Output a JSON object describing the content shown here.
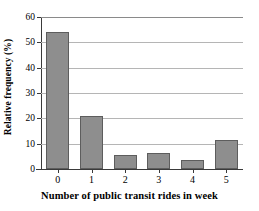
{
  "chart_data": {
    "type": "bar",
    "title": "",
    "xlabel": "Number of public transit rides in week",
    "ylabel": "Relative frequency (%)",
    "categories": [
      "0",
      "1",
      "2",
      "3",
      "4",
      "5"
    ],
    "values": [
      54,
      21,
      5.5,
      6.5,
      3.5,
      11.5
    ],
    "ylim": [
      0,
      60
    ],
    "yticks": [
      "0",
      "10",
      "20",
      "30",
      "40",
      "50",
      "60"
    ],
    "ytick_values": [
      0,
      10,
      20,
      30,
      40,
      50,
      60
    ],
    "grid": "horizontal",
    "legend": "none",
    "bar_color": "#8e8e8e",
    "bar_edge_color": "#5d5d5d",
    "gridline_color": "#b5b5b5",
    "axis_color": "#3a3a3a",
    "background": "#ffffff"
  }
}
